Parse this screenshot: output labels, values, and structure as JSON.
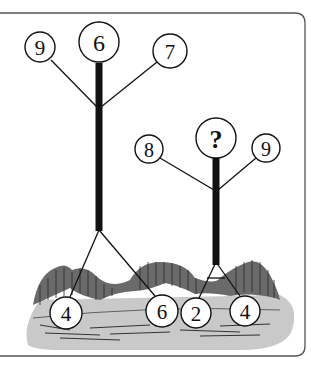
{
  "puzzle": {
    "left_tree": {
      "top": "6",
      "left": "9",
      "right": "7",
      "bottom_left": "4",
      "bottom_right": "6"
    },
    "right_tree": {
      "top": "?",
      "left": "8",
      "right": "9",
      "bottom_left": "2",
      "bottom_right": "4"
    }
  },
  "colors": {
    "frame": "#444444",
    "ink": "#111111",
    "ground": "#c8c8c8",
    "hills": "#555555"
  }
}
